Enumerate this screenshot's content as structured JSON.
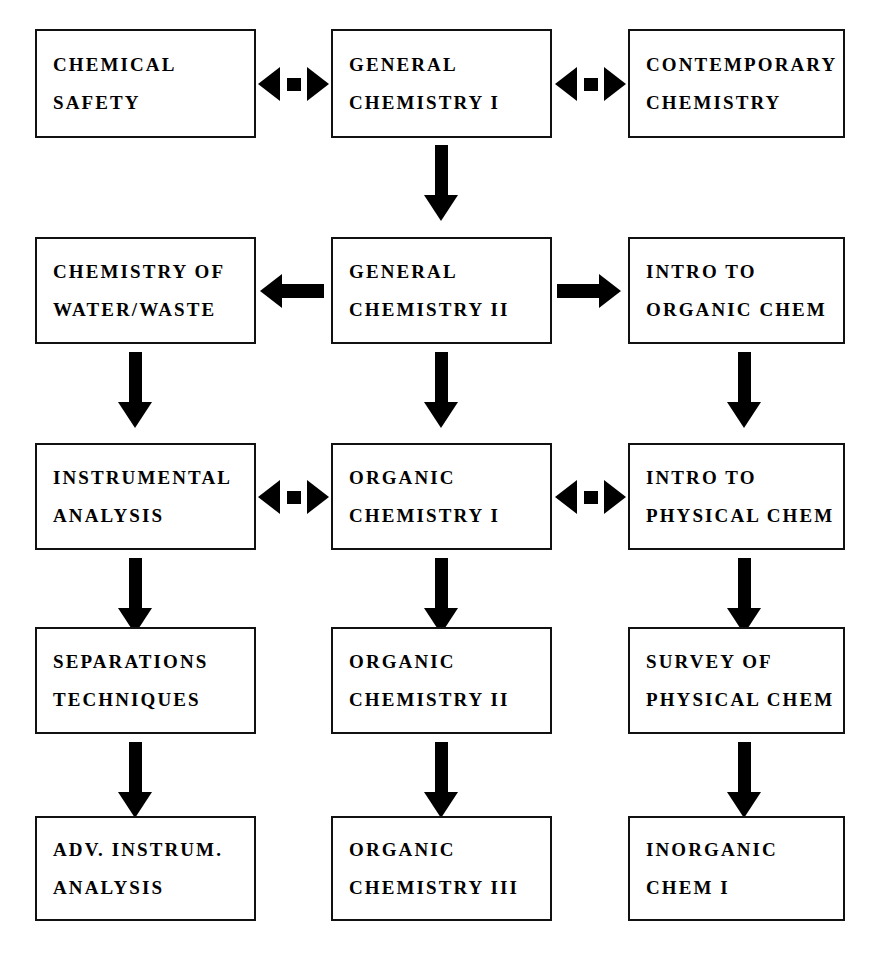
{
  "diagram": {
    "colors": {
      "box_border": "#111111",
      "arrow": "#000000",
      "background": "#ffffff",
      "text": "#000000"
    },
    "columns": [
      "left",
      "middle",
      "right"
    ],
    "rows": [
      {
        "row": 1,
        "boxes": [
          {
            "id": "chemical-safety",
            "line1": "CHEMICAL",
            "line2": "SAFETY"
          },
          {
            "id": "general-chemistry-i",
            "line1": "GENERAL",
            "line2": "CHEMISTRY I"
          },
          {
            "id": "contemporary-chemistry",
            "line1": "CONTEMPORARY",
            "line2": "CHEMISTRY"
          }
        ]
      },
      {
        "row": 2,
        "boxes": [
          {
            "id": "chemistry-of-water-waste",
            "line1": "CHEMISTRY OF",
            "line2": "WATER/WASTE"
          },
          {
            "id": "general-chemistry-ii",
            "line1": "GENERAL",
            "line2": "CHEMISTRY II"
          },
          {
            "id": "intro-to-organic-chem",
            "line1": "INTRO TO",
            "line2": "ORGANIC CHEM"
          }
        ]
      },
      {
        "row": 3,
        "boxes": [
          {
            "id": "instrumental-analysis",
            "line1": "INSTRUMENTAL",
            "line2": "ANALYSIS"
          },
          {
            "id": "organic-chemistry-i",
            "line1": "ORGANIC",
            "line2": "CHEMISTRY I"
          },
          {
            "id": "intro-to-physical-chem",
            "line1": "INTRO TO",
            "line2": "PHYSICAL CHEM"
          }
        ]
      },
      {
        "row": 4,
        "boxes": [
          {
            "id": "separations-techniques",
            "line1": "SEPARATIONS",
            "line2": "TECHNIQUES"
          },
          {
            "id": "organic-chemistry-ii",
            "line1": "ORGANIC",
            "line2": "CHEMISTRY II"
          },
          {
            "id": "survey-of-physical-chem",
            "line1": "SURVEY OF",
            "line2": "PHYSICAL CHEM"
          }
        ]
      },
      {
        "row": 5,
        "boxes": [
          {
            "id": "adv-instrum-analysis",
            "line1": "ADV. INSTRUM.",
            "line2": "ANALYSIS"
          },
          {
            "id": "organic-chemistry-iii",
            "line1": "ORGANIC",
            "line2": "CHEMISTRY III"
          },
          {
            "id": "inorganic-chem-i",
            "line1": "INORGANIC",
            "line2": "CHEM I"
          }
        ]
      }
    ],
    "connectors": {
      "horizontal": [
        {
          "id": "safety-genchem1",
          "type": "bidirectional",
          "from": "chemical-safety",
          "to": "general-chemistry-i"
        },
        {
          "id": "genchem1-contemporary",
          "type": "bidirectional",
          "from": "general-chemistry-i",
          "to": "contemporary-chemistry"
        },
        {
          "id": "genchem2-waterwaste",
          "type": "left",
          "from": "general-chemistry-ii",
          "to": "chemistry-of-water-waste"
        },
        {
          "id": "genchem2-introorganic",
          "type": "right",
          "from": "general-chemistry-ii",
          "to": "intro-to-organic-chem"
        },
        {
          "id": "instrumental-organic1",
          "type": "bidirectional",
          "from": "instrumental-analysis",
          "to": "organic-chemistry-i"
        },
        {
          "id": "organic1-introphysical",
          "type": "bidirectional",
          "from": "organic-chemistry-i",
          "to": "intro-to-physical-chem"
        }
      ],
      "vertical": [
        {
          "id": "genchem1-genchem2",
          "from": "general-chemistry-i",
          "to": "general-chemistry-ii"
        },
        {
          "id": "waterwaste-instrumental",
          "from": "chemistry-of-water-waste",
          "to": "instrumental-analysis"
        },
        {
          "id": "genchem2-organic1",
          "from": "general-chemistry-ii",
          "to": "organic-chemistry-i"
        },
        {
          "id": "introorganic-introphysical",
          "from": "intro-to-organic-chem",
          "to": "intro-to-physical-chem"
        },
        {
          "id": "instrumental-separations",
          "from": "instrumental-analysis",
          "to": "separations-techniques"
        },
        {
          "id": "organic1-organic2",
          "from": "organic-chemistry-i",
          "to": "organic-chemistry-ii"
        },
        {
          "id": "introphysical-surveyphysical",
          "from": "intro-to-physical-chem",
          "to": "survey-of-physical-chem"
        },
        {
          "id": "separations-advinstrum",
          "from": "separations-techniques",
          "to": "adv-instrum-analysis"
        },
        {
          "id": "organic2-organic3",
          "from": "organic-chemistry-ii",
          "to": "organic-chemistry-iii"
        },
        {
          "id": "surveyphysical-inorganic1",
          "from": "survey-of-physical-chem",
          "to": "inorganic-chem-i"
        }
      ]
    }
  }
}
